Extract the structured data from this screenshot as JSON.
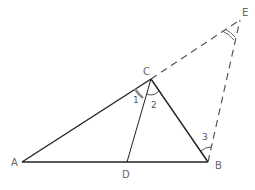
{
  "diagram": {
    "type": "geometry",
    "points": {
      "A": {
        "label": "A",
        "x": 22,
        "y": 162
      },
      "B": {
        "label": "B",
        "x": 208,
        "y": 162
      },
      "C": {
        "label": "C",
        "x": 151,
        "y": 79
      },
      "D": {
        "label": "D",
        "x": 127,
        "y": 162
      },
      "E": {
        "label": "E",
        "x": 240,
        "y": 20
      }
    },
    "angle_labels": {
      "one": "1",
      "two": "2",
      "three": "3"
    },
    "segments": [
      {
        "from": "A",
        "to": "B",
        "style": "solid"
      },
      {
        "from": "A",
        "to": "C",
        "style": "solid"
      },
      {
        "from": "C",
        "to": "B",
        "style": "solid"
      },
      {
        "from": "C",
        "to": "D",
        "style": "solid"
      },
      {
        "from": "C",
        "to": "E",
        "style": "dashed"
      },
      {
        "from": "B",
        "to": "E",
        "style": "dashed"
      }
    ],
    "colors": {
      "solid_line": "#222222",
      "dashed_line": "#555555",
      "label": "#666666"
    }
  }
}
